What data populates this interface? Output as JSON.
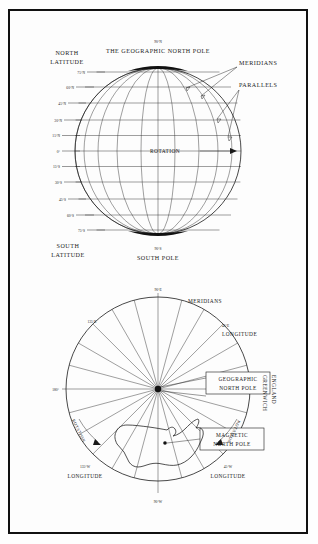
{
  "figure": {
    "border_color": "#111111",
    "ink_color": "#1a1a1a",
    "background": "#fdfdfd"
  },
  "globe": {
    "north_pole_degree": "90°N",
    "north_pole_caption": "THE GEOGRAPHIC NORTH POLE",
    "south_pole_degree": "90°S",
    "south_pole_caption": "SOUTH POLE",
    "north_latitude_label_line1": "NORTH",
    "north_latitude_label_line2": "LATITUDE",
    "south_latitude_label_line1": "SOUTH",
    "south_latitude_label_line2": "LATITUDE",
    "meridians_label": "MERIDIANS",
    "parallels_label": "PARALLELS",
    "rotation_label": "ROTATION",
    "latitude_ticks": [
      "75°N",
      "60°N",
      "45°N",
      "30°N",
      "15°N",
      "0°",
      "15°S",
      "30°S",
      "45°S",
      "60°S",
      "75°S"
    ]
  },
  "polar": {
    "meridians_label": "MERIDIANS",
    "geographic_pole_line1": "GEOGRAPHIC",
    "geographic_pole_line2": "NORTH POLE",
    "magnetic_pole_line1": "MAGNETIC",
    "magnetic_pole_line2": "NORTH POLE",
    "greenwich_line1": "GREENWICH",
    "greenwich_line2": "ENGLAND",
    "rotation_label_left": "ROTATION",
    "rotation_label_right": "ROTATION",
    "longitude_word": "LONGITUDE",
    "ticks": {
      "top": "90°E",
      "upper_right": "45°E",
      "upper_left": "135°E",
      "left": "180°",
      "lower_left": "135°W",
      "lower_right": "45°W",
      "bottom": "90°W"
    }
  }
}
